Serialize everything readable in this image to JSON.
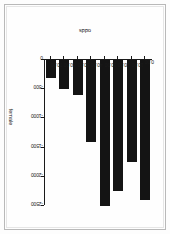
{
  "figure": {
    "background_color": "#fefefe",
    "frame_color": "#b9b9b9",
    "bar_color": "#141414",
    "axis_color": "#1a1a1a"
  },
  "chart_data": {
    "type": "bar",
    "orientation": "horizontal",
    "rotation_degrees": 90,
    "title": "",
    "xlabel": "odds",
    "ylabel": "female",
    "categories": [
      "0.00",
      "10.00",
      "20.00",
      "30.00",
      "40.00",
      "50.00",
      "60.00",
      "70.00"
    ],
    "values": [
      -2400,
      -1750,
      -2250,
      -2500,
      -1400,
      -600,
      -500,
      -300
    ],
    "xlim": [
      0,
      70
    ],
    "ylim": [
      -2500,
      0
    ],
    "x_tick_labels": [
      "0.00",
      "10.00",
      "20.00",
      "30.00",
      "40.00",
      "50.00",
      "60.00",
      "70.00"
    ],
    "y_tick_labels": [
      "0",
      "-500",
      "-1000",
      "-1500",
      "-2000",
      "-2500"
    ],
    "y_ticks": [
      0,
      -500,
      -1000,
      -1500,
      -2000,
      -2500
    ],
    "grid": false,
    "legend": "none"
  }
}
